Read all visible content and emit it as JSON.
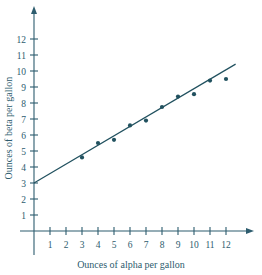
{
  "chart_data": {
    "type": "scatter",
    "title": "",
    "xlabel": "Ounces of alpha per gallon",
    "ylabel": "Ounces of beta per gallon",
    "xlim": [
      0,
      13
    ],
    "ylim": [
      0,
      12.8
    ],
    "xticks": [
      1,
      2,
      3,
      4,
      5,
      6,
      7,
      8,
      9,
      10,
      11,
      12
    ],
    "yticks": [
      1,
      2,
      3,
      4,
      5,
      6,
      7,
      8,
      9,
      10,
      11,
      12
    ],
    "xtick_labels": [
      "1",
      "2",
      "3",
      "4",
      "5",
      "6",
      "7",
      "8",
      "9",
      "10",
      "11",
      "12"
    ],
    "ytick_labels": [
      "1",
      "2",
      "3",
      "4",
      "5",
      "6",
      "7",
      "8",
      "9",
      "10",
      "11",
      "12"
    ],
    "grid": false,
    "legend": null,
    "x": [
      3,
      4,
      5,
      6,
      7,
      8,
      9,
      10,
      11,
      12
    ],
    "y": [
      4.6,
      5.5,
      5.7,
      6.6,
      6.9,
      7.75,
      8.4,
      8.55,
      9.4,
      9.5
    ],
    "points": [
      {
        "x": 3,
        "y": 4.6
      },
      {
        "x": 4,
        "y": 5.5
      },
      {
        "x": 5,
        "y": 5.7
      },
      {
        "x": 6,
        "y": 6.6
      },
      {
        "x": 7,
        "y": 6.9
      },
      {
        "x": 8,
        "y": 7.75
      },
      {
        "x": 9,
        "y": 8.4
      },
      {
        "x": 10,
        "y": 8.55
      },
      {
        "x": 11,
        "y": 9.4
      },
      {
        "x": 12,
        "y": 9.5
      }
    ],
    "trend_line": {
      "intercept": 3.0,
      "slope": 0.59,
      "x_start": 0,
      "x_end": 12.6,
      "y_start": 3.0,
      "y_end": 10.43
    },
    "marker_color": "#21515f",
    "line_color": "#21515f",
    "axis_color": "#2d5c6e"
  }
}
